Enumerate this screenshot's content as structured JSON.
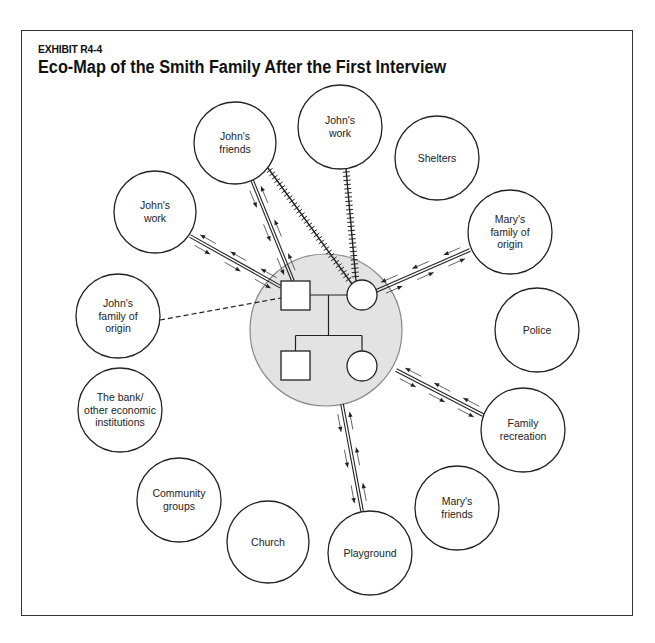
{
  "header": {
    "exhibit": "EXHIBIT R4-4",
    "title": "Eco-Map of the Smith Family After the First Interview"
  },
  "colors": {
    "line": "#222222",
    "household_fill": "#e3e3e3",
    "household_stroke": "#888888",
    "node_stroke": "#222222"
  },
  "household": {
    "cx": 326,
    "cy": 330,
    "r": 76,
    "members": [
      {
        "id": "father",
        "shape": "square",
        "x": 281,
        "y": 281,
        "size": 29
      },
      {
        "id": "mother",
        "shape": "circle",
        "cx": 362,
        "cy": 295,
        "r": 15
      },
      {
        "id": "son",
        "shape": "square",
        "x": 281,
        "y": 351,
        "size": 29
      },
      {
        "id": "daughter",
        "shape": "circle",
        "cx": 362,
        "cy": 366,
        "r": 15
      }
    ]
  },
  "nodes": [
    {
      "id": "johns-work-top",
      "lines": [
        "John's",
        "work"
      ],
      "cx": 340,
      "cy": 127,
      "r": 42
    },
    {
      "id": "johns-friends",
      "lines": [
        "John's",
        "friends"
      ],
      "cx": 235,
      "cy": 143,
      "r": 41
    },
    {
      "id": "shelters",
      "lines": [
        "Shelters"
      ],
      "cx": 437,
      "cy": 158,
      "r": 42
    },
    {
      "id": "johns-work-left",
      "lines": [
        "John's",
        "work"
      ],
      "cx": 155,
      "cy": 212,
      "r": 41
    },
    {
      "id": "marys-family-of-origin",
      "lines": [
        "Mary's",
        "family of",
        "origin"
      ],
      "cx": 510,
      "cy": 232,
      "r": 42
    },
    {
      "id": "johns-family-of-origin",
      "lines": [
        "John's",
        "family of",
        "origin"
      ],
      "cx": 118,
      "cy": 316,
      "r": 42
    },
    {
      "id": "police",
      "lines": [
        "Police"
      ],
      "cx": 537,
      "cy": 330,
      "r": 42
    },
    {
      "id": "bank",
      "lines": [
        "The bank/",
        "other economic",
        "institutions"
      ],
      "cx": 120,
      "cy": 410,
      "r": 42
    },
    {
      "id": "family-recreation",
      "lines": [
        "Family",
        "recreation"
      ],
      "cx": 523,
      "cy": 430,
      "r": 42
    },
    {
      "id": "community-groups",
      "lines": [
        "Community",
        "groups"
      ],
      "cx": 179,
      "cy": 500,
      "r": 42
    },
    {
      "id": "marys-friends",
      "lines": [
        "Mary's",
        "friends"
      ],
      "cx": 457,
      "cy": 508,
      "r": 42
    },
    {
      "id": "church",
      "lines": [
        "Church"
      ],
      "cx": 268,
      "cy": 542,
      "r": 41
    },
    {
      "id": "playground",
      "lines": [
        "Playground"
      ],
      "cx": 370,
      "cy": 553,
      "r": 42
    }
  ],
  "connections": [
    {
      "from": "johns-work-left",
      "to": "father",
      "type": "strong",
      "flow": "both",
      "x1": 190,
      "y1": 236,
      "x2": 281,
      "y2": 287
    },
    {
      "from": "johns-friends",
      "to": "father",
      "type": "strong",
      "flow": "both",
      "x1": 252,
      "y1": 180,
      "x2": 293,
      "y2": 281
    },
    {
      "from": "johns-friends",
      "to": "mother",
      "type": "stressful",
      "x1": 268,
      "y1": 168,
      "x2": 352,
      "y2": 284
    },
    {
      "from": "johns-work-top",
      "to": "mother",
      "type": "stressful",
      "x1": 346,
      "y1": 169,
      "x2": 356,
      "y2": 281
    },
    {
      "from": "marys-family-of-origin",
      "to": "mother",
      "type": "strong",
      "flow": "both",
      "x1": 470,
      "y1": 250,
      "x2": 376,
      "y2": 291
    },
    {
      "from": "johns-family-of-origin",
      "to": "father",
      "type": "tenuous",
      "x1": 160,
      "y1": 320,
      "x2": 281,
      "y2": 298
    },
    {
      "from": "family-recreation",
      "to": "household",
      "type": "strong",
      "flow": "both",
      "x1": 483,
      "y1": 415,
      "x2": 396,
      "y2": 370
    },
    {
      "from": "playground",
      "to": "household",
      "type": "strong",
      "flow": "both",
      "x1": 362,
      "y1": 511,
      "x2": 342,
      "y2": 404
    }
  ],
  "legend_note": {
    "strong": "double solid line",
    "stressful": "hatched line",
    "tenuous": "dashed line"
  }
}
